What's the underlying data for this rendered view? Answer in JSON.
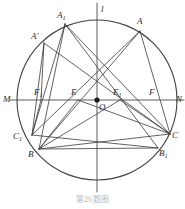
{
  "figure": {
    "caption": "第26题图",
    "stroke_color": "#3a3a3a",
    "circle_color": "#3f3f3f",
    "background": "#ffffff",
    "width": 185,
    "height": 209
  },
  "circle": {
    "center_x": 97,
    "center_y": 100,
    "radius": 80,
    "center_dot_label": "O",
    "center_dot_radius": 2.6
  },
  "axes": {
    "horizontal_line": {
      "name": "MN",
      "x1": 10,
      "y1": 100,
      "x2": 184,
      "y2": 100
    },
    "vertical_line": {
      "name": "l",
      "x1": 97,
      "y1": 3,
      "x2": 97,
      "y2": 192
    }
  },
  "points": [
    {
      "id": "A1",
      "label": "A",
      "sub": "1",
      "prime": "",
      "x": 65,
      "y": 24,
      "lx": 57,
      "ly": 11
    },
    {
      "id": "A",
      "label": "A",
      "sub": "",
      "prime": "",
      "x": 140,
      "y": 31,
      "lx": 137,
      "ly": 17
    },
    {
      "id": "Ap",
      "label": "A",
      "sub": "",
      "prime": "'",
      "x": 44,
      "y": 43,
      "lx": 31,
      "ly": 32
    },
    {
      "id": "M",
      "label": "M",
      "sub": "",
      "prime": "",
      "x": 17,
      "y": 100,
      "lx": 3,
      "ly": 95
    },
    {
      "id": "N",
      "label": "N",
      "sub": "",
      "prime": "",
      "x": 177,
      "y": 100,
      "lx": 176,
      "ly": 95
    },
    {
      "id": "F1",
      "label": "F",
      "sub": "1",
      "prime": "",
      "x": 41,
      "y": 100,
      "lx": 34,
      "ly": 88
    },
    {
      "id": "E",
      "label": "E",
      "sub": "",
      "prime": "",
      "x": 78,
      "y": 100,
      "lx": 71,
      "ly": 88
    },
    {
      "id": "E1",
      "label": "E",
      "sub": "1",
      "prime": "",
      "x": 120,
      "y": 100,
      "lx": 113,
      "ly": 88
    },
    {
      "id": "F",
      "label": "F",
      "sub": "",
      "prime": "",
      "x": 153,
      "y": 100,
      "lx": 149,
      "ly": 88
    },
    {
      "id": "O",
      "label": "O",
      "sub": "",
      "prime": "",
      "x": 97,
      "y": 100,
      "lx": 99,
      "ly": 103
    },
    {
      "id": "C1",
      "label": "C",
      "sub": "1",
      "prime": "",
      "x": 32,
      "y": 135,
      "lx": 13,
      "ly": 132
    },
    {
      "id": "C",
      "label": "C",
      "sub": "",
      "prime": "",
      "x": 170,
      "y": 134,
      "lx": 172,
      "ly": 131
    },
    {
      "id": "B",
      "label": "B",
      "sub": "",
      "prime": "",
      "x": 39,
      "y": 149,
      "lx": 28,
      "ly": 150
    },
    {
      "id": "B1",
      "label": "B",
      "sub": "1",
      "prime": "",
      "x": 158,
      "y": 148,
      "lx": 159,
      "ly": 149
    }
  ],
  "segments": [
    {
      "name": "A1-B",
      "from": "A1",
      "to": "B"
    },
    {
      "name": "A1-C",
      "from": "A1",
      "to": "C"
    },
    {
      "name": "A1-B1",
      "from": "A1",
      "to": "B1"
    },
    {
      "name": "A1-C1",
      "from": "A1",
      "to": "C1"
    },
    {
      "name": "A-B",
      "from": "A",
      "to": "B"
    },
    {
      "name": "A-C",
      "from": "A",
      "to": "C"
    },
    {
      "name": "A-C1",
      "from": "A",
      "to": "C1"
    },
    {
      "name": "Ap-F1",
      "from": "Ap",
      "to": "F1"
    },
    {
      "name": "Ap-C1",
      "from": "Ap",
      "to": "C1"
    },
    {
      "name": "Ap-C",
      "from": "Ap",
      "to": "C"
    },
    {
      "name": "B-C",
      "from": "B",
      "to": "C"
    },
    {
      "name": "C1-B1",
      "from": "C1",
      "to": "B1"
    },
    {
      "name": "B-E",
      "from": "B",
      "to": "E"
    },
    {
      "name": "B-E1",
      "from": "B",
      "to": "E1"
    },
    {
      "name": "C-E1",
      "from": "C",
      "to": "E1"
    },
    {
      "name": "C-E",
      "from": "C",
      "to": "E"
    },
    {
      "name": "F1-C1",
      "from": "F1",
      "to": "C1"
    },
    {
      "name": "B-B1",
      "from": "B",
      "to": "B1"
    }
  ],
  "line_label": {
    "text": "l",
    "x": 101,
    "y": 5
  }
}
